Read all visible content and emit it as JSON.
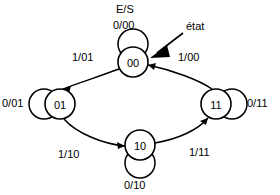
{
  "diagram": {
    "title_label": "E/S",
    "annotation": {
      "text": "état",
      "icon": "arrow-pointer-icon",
      "points_to": "00"
    },
    "states": [
      {
        "id": "s00",
        "label": "00",
        "position": "top",
        "cx": 133,
        "cy": 62,
        "r": 15
      },
      {
        "id": "s01",
        "label": "01",
        "position": "left",
        "cx": 60,
        "cy": 104,
        "r": 15
      },
      {
        "id": "s11",
        "label": "11",
        "position": "right",
        "cx": 216,
        "cy": 104,
        "r": 15
      },
      {
        "id": "s10",
        "label": "10",
        "position": "bottom",
        "cx": 140,
        "cy": 145,
        "r": 15
      }
    ],
    "transitions": [
      {
        "from": "00",
        "to": "01",
        "label": "1/01",
        "input": "1",
        "output": "01"
      },
      {
        "from": "01",
        "to": "10",
        "label": "1/10",
        "input": "1",
        "output": "10"
      },
      {
        "from": "10",
        "to": "11",
        "label": "1/11",
        "input": "1",
        "output": "11"
      },
      {
        "from": "11",
        "to": "00",
        "label": "1/00",
        "input": "1",
        "output": "00"
      }
    ],
    "self_loops": [
      {
        "state": "00",
        "label": "0/00",
        "input": "0",
        "output": "00",
        "side": "top"
      },
      {
        "state": "01",
        "label": "0/01",
        "input": "0",
        "output": "01",
        "side": "left"
      },
      {
        "state": "11",
        "label": "0/11",
        "input": "0",
        "output": "11",
        "side": "right"
      },
      {
        "state": "10",
        "label": "0/10",
        "input": "0",
        "output": "10",
        "side": "bottom"
      }
    ],
    "colors": {
      "stroke": "#000000",
      "background": "#ffffff",
      "text": "#000000"
    }
  }
}
